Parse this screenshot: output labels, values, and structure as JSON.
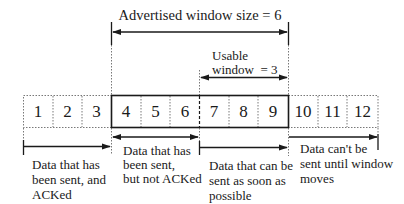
{
  "diagram": {
    "advertised_window_label": "Advertised window size = 6",
    "usable_window_label_line1": "Usable",
    "usable_window_label_line2": "window  = 3",
    "cells": [
      "1",
      "2",
      "3",
      "4",
      "5",
      "6",
      "7",
      "8",
      "9",
      "10",
      "11",
      "12"
    ],
    "regions": {
      "sent_acked": {
        "lines": [
          "Data that has",
          "been sent, and",
          "ACKed"
        ]
      },
      "sent_not_acked": {
        "lines": [
          "Data that has",
          "been sent,",
          "but not ACKed"
        ]
      },
      "can_send": {
        "lines": [
          "Data that can be",
          "sent as soon as",
          "possible"
        ]
      },
      "cannot_send": {
        "lines": [
          "Data can't be",
          "sent until window",
          "moves"
        ]
      }
    },
    "colors": {
      "ink": "#1a1a1a",
      "dotted": "#555555",
      "background": "#ffffff"
    }
  }
}
